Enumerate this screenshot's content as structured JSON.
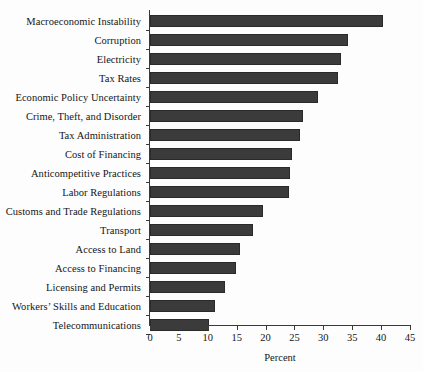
{
  "chart_data": {
    "type": "bar",
    "orientation": "horizontal",
    "title": "",
    "xlabel": "Percent",
    "ylabel": "",
    "xlim": [
      0,
      45
    ],
    "xticks": [
      0,
      5,
      10,
      15,
      20,
      25,
      30,
      35,
      40,
      45
    ],
    "grid": false,
    "legend": false,
    "bar_color": "#3b3b3b",
    "background_color": "#fdfdfd",
    "categories": [
      "Macroeconomic Instability",
      "Corruption",
      "Electricity",
      "Tax Rates",
      "Economic Policy Uncertainty",
      "Crime, Theft, and Disorder",
      "Tax Administration",
      "Cost of Financing",
      "Anticompetitive Practices",
      "Labor Regulations",
      "Customs and Trade Regulations",
      "Transport",
      "Access to Land",
      "Access to Financing",
      "Licensing and Permits",
      "Workers’ Skills and Education",
      "Telecommunications"
    ],
    "values": [
      40.3,
      34.3,
      33.0,
      32.5,
      29.0,
      26.5,
      26.0,
      24.6,
      24.2,
      24.0,
      19.5,
      17.8,
      15.6,
      14.8,
      12.9,
      11.2,
      10.2
    ]
  }
}
